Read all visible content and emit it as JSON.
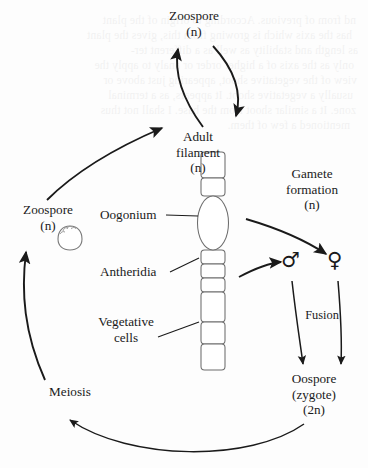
{
  "diagram": {
    "background_color": "#fdfdfd",
    "ink_color": "#1a1a1a",
    "nodes": {
      "zoospore_top": {
        "name": "Zoospore",
        "ploidy": "(n)"
      },
      "zoospore_left": {
        "name": "Zoospore",
        "ploidy": "(n)"
      },
      "adult_filament": {
        "name": "Adult",
        "name2": "filament",
        "ploidy": "(n)"
      },
      "gamete_formation": {
        "name": "Gamete",
        "name2": "formation",
        "ploidy": "(n)"
      },
      "oospore": {
        "name": "Oospore",
        "name2": "(zygote)",
        "ploidy": "(2n)"
      },
      "meiosis": {
        "name": "Meiosis"
      },
      "fusion": {
        "name": "Fusion"
      }
    },
    "callouts": {
      "oogonium": "Oogonium",
      "antheridia": "Antheridia",
      "vegetative_cells_line1": "Vegetative",
      "vegetative_cells_line2": "cells"
    },
    "gametes": {
      "male_symbol": "♂",
      "female_symbol": "♀"
    },
    "bleed_text": [
      "nd from of previous. According to origin of the plant",
      "has the axis which is growing from this, gives the plant",
      "as length and stability as well as a different ter-",
      "only as the axis of a higher order or analy to apply the",
      "view of the vegetative shoot, appearing just above or",
      "usually a vegetative shoot. It appears, as a terminal",
      "zone. It a similar shoot from the base. I shall not thus",
      "mentioned a few of them."
    ]
  }
}
